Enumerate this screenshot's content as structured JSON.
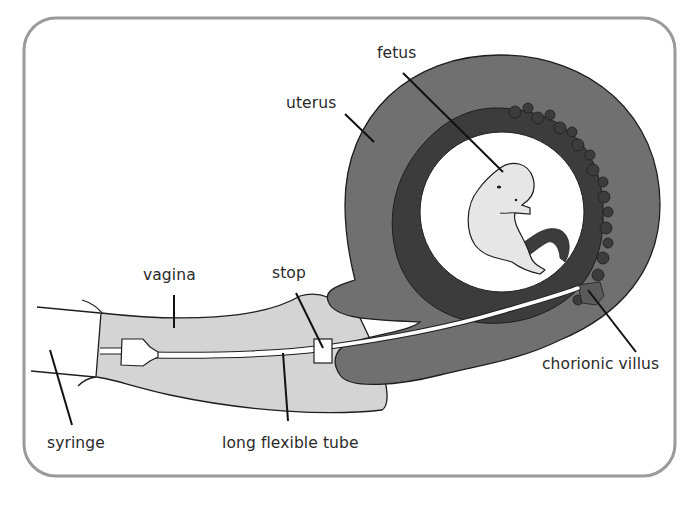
{
  "diagram": {
    "colors": {
      "frame": "#9a9a9a",
      "uterus": "#707070",
      "chorion": "#3c3c3c",
      "amniotic_sac": "#ffffff",
      "fetus": "#e6e6e6",
      "vagina": "#d4d4d4",
      "outline": "#1e1e1e",
      "tube": "#ffffff",
      "label_text": "#2a2a2a"
    },
    "labels": {
      "fetus": "fetus",
      "uterus": "uterus",
      "vagina": "vagina",
      "stop": "stop",
      "syringe": "syringe",
      "tube": "long flexible tube",
      "chorionic_villus": "chorionic villus"
    }
  }
}
